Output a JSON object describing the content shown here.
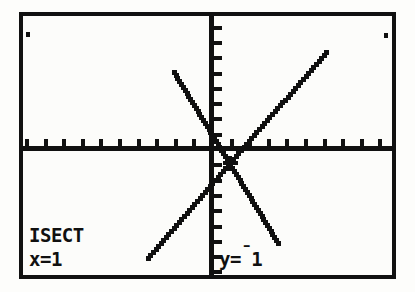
{
  "device": {
    "type": "graphing-calculator-screen",
    "background_color": "#fdfdfb",
    "ink_color": "#101010"
  },
  "readout": {
    "mode_label": "ISECT",
    "x_label": "x=1",
    "y_label_prefix": "y=",
    "y_negative_sign": "¯",
    "y_value": "1"
  },
  "chart_data": {
    "type": "line",
    "title": "",
    "xlabel": "",
    "ylabel": "",
    "xlim": [
      -10,
      10
    ],
    "ylim": [
      -10,
      10
    ],
    "grid": false,
    "legend": false,
    "axes": {
      "x_axis_y": 0,
      "y_axis_x": 0,
      "xscl": 1,
      "yscl": 1,
      "tick_marks": true
    },
    "series": [
      {
        "name": "Y1",
        "slope": -2,
        "intercept": 1,
        "x": [
          -2.0,
          3.6
        ],
        "values": [
          5.0,
          -6.2
        ]
      },
      {
        "name": "Y2",
        "slope": 1.4,
        "intercept": -2.4,
        "x": [
          -3.4,
          6.2
        ],
        "values": [
          -7.2,
          6.3
        ]
      }
    ],
    "annotations": [
      {
        "kind": "intersection-cursor",
        "x": 1,
        "y": -1,
        "label": "ISECT"
      }
    ]
  }
}
